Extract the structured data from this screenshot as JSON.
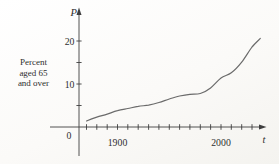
{
  "figure": {
    "background": "#fbfaf8",
    "ink_color": "#3e3e3e",
    "curve_color": "#6b6b6b",
    "y_axis_title": "P",
    "x_axis_title": "t",
    "origin_label": "0",
    "side_label_lines": [
      "Percent",
      "aged 65",
      "and over"
    ],
    "y_tick_labels": [
      "10",
      "20"
    ],
    "x_tick_labels": [
      "1900",
      "2000"
    ]
  },
  "chart_data": {
    "type": "line",
    "title": "Percent aged 65 and over",
    "xlabel": "t",
    "ylabel": "P",
    "x": [
      1870,
      1880,
      1890,
      1900,
      1910,
      1920,
      1930,
      1940,
      1950,
      1960,
      1970,
      1980,
      1990,
      2000,
      2010,
      2020,
      2030,
      2038
    ],
    "y": [
      1.4,
      2.3,
      3.0,
      3.8,
      4.3,
      4.8,
      5.1,
      5.7,
      6.5,
      7.2,
      7.6,
      7.8,
      9.1,
      11.4,
      12.6,
      15.1,
      18.6,
      20.6
    ],
    "x_ticks": [
      1870,
      1880,
      1890,
      1900,
      1910,
      1920,
      1930,
      1940,
      1950,
      1960,
      1970,
      1980,
      1990,
      2000,
      2010,
      2020,
      2030
    ],
    "x_labeled_ticks": [
      1900,
      2000
    ],
    "y_ticks": [
      5,
      10,
      15,
      20
    ],
    "y_labeled_ticks": [
      10,
      20
    ],
    "xlim": [
      1835,
      2043
    ],
    "ylim": [
      0,
      26
    ],
    "grid": false,
    "legend": null
  }
}
